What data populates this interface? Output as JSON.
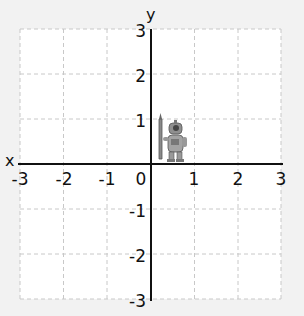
{
  "diagram": {
    "type": "coordinate-plane",
    "x_axis": {
      "label": "x",
      "min": -3,
      "max": 3,
      "ticks": [
        "-3",
        "-2",
        "-1",
        "0",
        "1",
        "2",
        "3"
      ]
    },
    "y_axis": {
      "label": "y",
      "min": -3,
      "max": 3,
      "ticks": [
        "3",
        "2",
        "1",
        "-1",
        "-2",
        "-3"
      ]
    },
    "grid": {
      "style": "dashed",
      "color": "#c8c8c8",
      "background": "#ffffff"
    },
    "origin_label": "0",
    "figure": {
      "name": "robot-holding-pencil",
      "position_hint": "quadrant I near (0.5, 0.5)"
    }
  }
}
